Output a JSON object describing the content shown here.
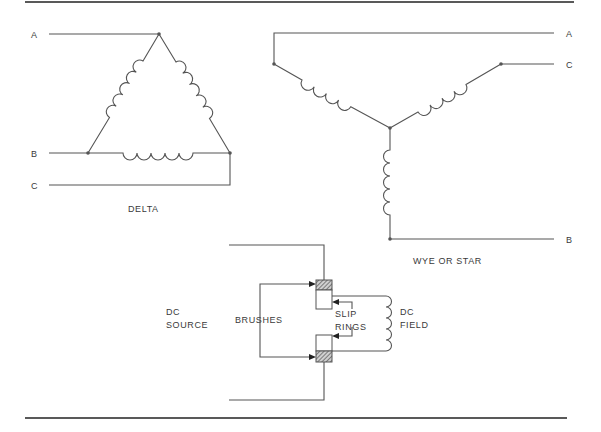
{
  "figure": {
    "delta": {
      "caption": "DELTA",
      "terminals": [
        {
          "label": "A"
        },
        {
          "label": "B"
        },
        {
          "label": "C"
        }
      ]
    },
    "wye": {
      "caption": "WYE OR STAR",
      "terminals": [
        {
          "label": "A"
        },
        {
          "label": "C"
        },
        {
          "label": "B"
        }
      ]
    },
    "rotor": {
      "dc_source_line1": "DC",
      "dc_source_line2": "SOURCE",
      "brushes": "BRUSHES",
      "slip_rings_line1": "SLIP",
      "slip_rings_line2": "RINGS",
      "dc_field_line1": "DC",
      "dc_field_line2": "FIELD"
    }
  },
  "colors": {
    "line": "#555555",
    "rule": "#222222",
    "text": "#3a3a3a",
    "hatch": "#555555"
  }
}
